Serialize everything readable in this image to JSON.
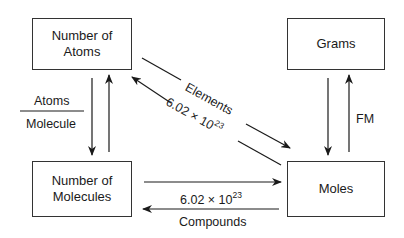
{
  "diagram": {
    "nodes": [
      {
        "id": "atoms",
        "label_line1": "Number of",
        "label_line2": "Atoms"
      },
      {
        "id": "molecules",
        "label_line1": "Number of",
        "label_line2": "Molecules"
      },
      {
        "id": "grams",
        "label": "Grams"
      },
      {
        "id": "moles",
        "label": "Moles"
      }
    ],
    "edges": {
      "atoms_molecules": {
        "numerator": "Atoms",
        "denominator": "Molecule"
      },
      "atoms_moles": {
        "label_top": "Elements",
        "label_bottom_base": "6.02 × 10",
        "label_bottom_exp": "23"
      },
      "molecules_moles": {
        "label_top_base": "6.02 × 10",
        "label_top_exp": "23",
        "label_bottom": "Compounds"
      },
      "grams_moles": {
        "label": "FM"
      }
    },
    "colors": {
      "line": "#1a1a1a",
      "border": "#333333",
      "background": "#ffffff"
    }
  }
}
